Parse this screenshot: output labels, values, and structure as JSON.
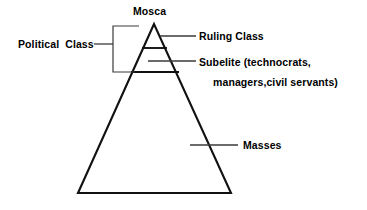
{
  "diagram": {
    "type": "pyramid-stratification-diagram",
    "background_color": "#ffffff",
    "line_color": "#000000",
    "text_color": "#000000",
    "labels": {
      "apex_label": "Mosca",
      "bracket_label": "Political  Class",
      "tier_top": "Ruling Class",
      "tier_middle_line1": "Subelite (technocrats,",
      "tier_middle_line2": "managers,civil servants)",
      "tier_bottom": "Masses"
    },
    "geometry": {
      "apex": [
        154,
        24
      ],
      "base_left": [
        78,
        193
      ],
      "base_right": [
        231,
        193
      ],
      "divider_top_y": 48,
      "divider_bottom_y": 72,
      "bracket_x": 113,
      "bracket_top_y": 26,
      "bracket_bottom_y": 72
    }
  }
}
